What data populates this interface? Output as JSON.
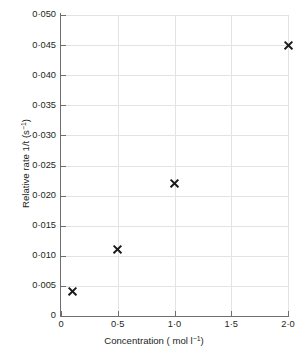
{
  "chart_data": {
    "type": "scatter",
    "title": "",
    "xlabel": "Concentration ( mol l⁻¹)",
    "ylabel": "Relative rate 1/t (s⁻¹)",
    "xlim": [
      0,
      2.0
    ],
    "ylim": [
      0,
      0.05
    ],
    "grid": true,
    "legend": false,
    "marker": "x",
    "marker_color": "#1a1a1a",
    "grid_color": "#e3e3e3",
    "axis_color": "#6e6e6e",
    "x": [
      0.1,
      0.5,
      1.0,
      2.0
    ],
    "values": [
      0.004,
      0.011,
      0.022,
      0.045
    ],
    "points": [
      {
        "x": 0.1,
        "y": 0.004
      },
      {
        "x": 0.5,
        "y": 0.011
      },
      {
        "x": 1.0,
        "y": 0.022
      },
      {
        "x": 2.0,
        "y": 0.045
      }
    ],
    "xticks": [
      0,
      0.5,
      1.0,
      1.5,
      2.0
    ],
    "xticklabels": [
      "0",
      "0·5",
      "1·0",
      "1·5",
      "2·0"
    ],
    "yticks": [
      0,
      0.005,
      0.01,
      0.015,
      0.02,
      0.025,
      0.03,
      0.035,
      0.04,
      0.045,
      0.05
    ],
    "yticklabels": [
      "0",
      "0·005",
      "0·010",
      "0·015",
      "0·020",
      "0·025",
      "0·030",
      "0·035",
      "0·040",
      "0·045",
      "0·050"
    ]
  },
  "axis_titles": {
    "x_prefix": "Concentration ( mol l",
    "x_exponent": "−1",
    "x_suffix": ")",
    "y_prefix": "Relative rate 1/t (s",
    "y_exponent": "−1",
    "y_suffix": ")"
  }
}
